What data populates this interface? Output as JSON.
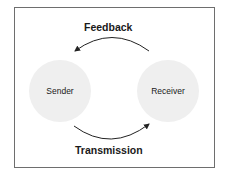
{
  "diagram": {
    "type": "communication-loop",
    "nodes": [
      {
        "id": "sender",
        "label": "Sender"
      },
      {
        "id": "receiver",
        "label": "Receiver"
      }
    ],
    "edges": [
      {
        "from": "receiver",
        "to": "sender",
        "label": "Feedback",
        "position": "top"
      },
      {
        "from": "sender",
        "to": "receiver",
        "label": "Transmission",
        "position": "bottom"
      }
    ]
  },
  "colors": {
    "node_fill": "#efefef",
    "border": "#6e6e6e",
    "arrow": "#222222",
    "text": "#1a1a1a"
  }
}
